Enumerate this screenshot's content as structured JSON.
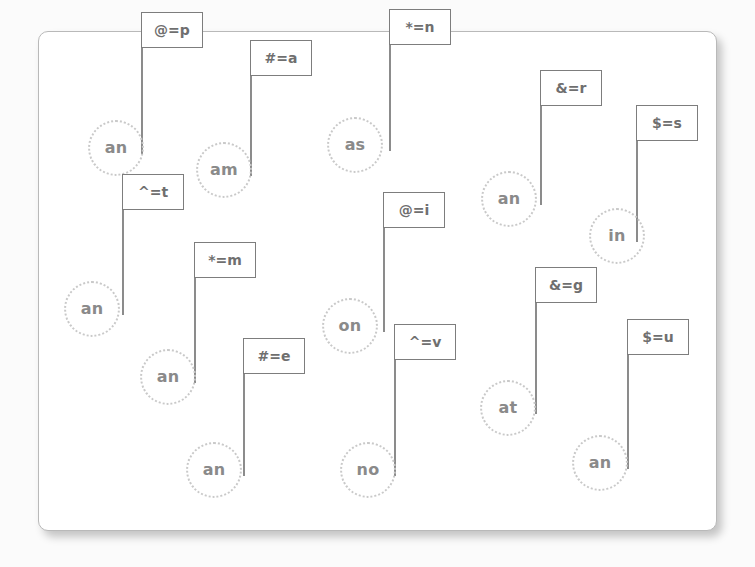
{
  "canvas": {
    "background_color": "#ffffff",
    "page_background_color": "#fbfbfb",
    "border_color": "#b9b9b9"
  },
  "style": {
    "circle_border_color": "#c9c9c9",
    "circle_text_color": "#8a8a8a",
    "flag_border_color": "#7d7d7d",
    "flag_text_color": "#6f6f6f",
    "pole_color": "#6f6f6f"
  },
  "items": [
    {
      "id": "item-1",
      "node_label": "an",
      "flag_label": "@=p",
      "circle": {
        "cx": 116,
        "cy": 148
      },
      "flag": {
        "x": 141,
        "y": 48
      }
    },
    {
      "id": "item-2",
      "node_label": "am",
      "flag_label": "#=a",
      "circle": {
        "cx": 224,
        "cy": 170
      },
      "flag": {
        "x": 250,
        "y": 76
      }
    },
    {
      "id": "item-3",
      "node_label": "as",
      "flag_label": "*=n",
      "circle": {
        "cx": 355,
        "cy": 145
      },
      "flag": {
        "x": 389,
        "y": 45
      }
    },
    {
      "id": "item-4",
      "node_label": "an",
      "flag_label": "&=r",
      "circle": {
        "cx": 509,
        "cy": 199
      },
      "flag": {
        "x": 540,
        "y": 106
      }
    },
    {
      "id": "item-5",
      "node_label": "in",
      "flag_label": "$=s",
      "circle": {
        "cx": 617,
        "cy": 236
      },
      "flag": {
        "x": 636,
        "y": 141
      }
    },
    {
      "id": "item-6",
      "node_label": "an",
      "flag_label": "^=t",
      "circle": {
        "cx": 92,
        "cy": 309
      },
      "flag": {
        "x": 122,
        "y": 210
      }
    },
    {
      "id": "item-7",
      "node_label": "an",
      "flag_label": "*=m",
      "circle": {
        "cx": 168,
        "cy": 377
      },
      "flag": {
        "x": 194,
        "y": 278
      }
    },
    {
      "id": "item-8",
      "node_label": "on",
      "flag_label": "@=i",
      "circle": {
        "cx": 350,
        "cy": 326
      },
      "flag": {
        "x": 383,
        "y": 228
      }
    },
    {
      "id": "item-9",
      "node_label": "an",
      "flag_label": "#=e",
      "circle": {
        "cx": 214,
        "cy": 470
      },
      "flag": {
        "x": 243,
        "y": 374
      }
    },
    {
      "id": "item-10",
      "node_label": "no",
      "flag_label": "^=v",
      "circle": {
        "cx": 368,
        "cy": 470
      },
      "flag": {
        "x": 394,
        "y": 360
      }
    },
    {
      "id": "item-11",
      "node_label": "at",
      "flag_label": "&=g",
      "circle": {
        "cx": 508,
        "cy": 408
      },
      "flag": {
        "x": 535,
        "y": 303
      }
    },
    {
      "id": "item-12",
      "node_label": "an",
      "flag_label": "$=u",
      "circle": {
        "cx": 600,
        "cy": 463
      },
      "flag": {
        "x": 627,
        "y": 355
      }
    }
  ]
}
